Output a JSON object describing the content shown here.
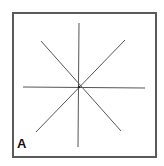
{
  "panel": {
    "label": "A",
    "border_color": "#5a5a5a",
    "line_color": "#555555"
  },
  "diagram": {
    "center": [
      79,
      87
    ],
    "lines": [
      {
        "name": "vertical",
        "x1": 79,
        "y1": 23,
        "x2": 78,
        "y2": 147
      },
      {
        "name": "horizontal",
        "x1": 23,
        "y1": 87,
        "x2": 145,
        "y2": 88
      },
      {
        "name": "diagonal-nw-se",
        "x1": 41,
        "y1": 41,
        "x2": 121,
        "y2": 131
      },
      {
        "name": "diagonal-ne-sw",
        "x1": 125,
        "y1": 40,
        "x2": 36,
        "y2": 132
      }
    ]
  }
}
